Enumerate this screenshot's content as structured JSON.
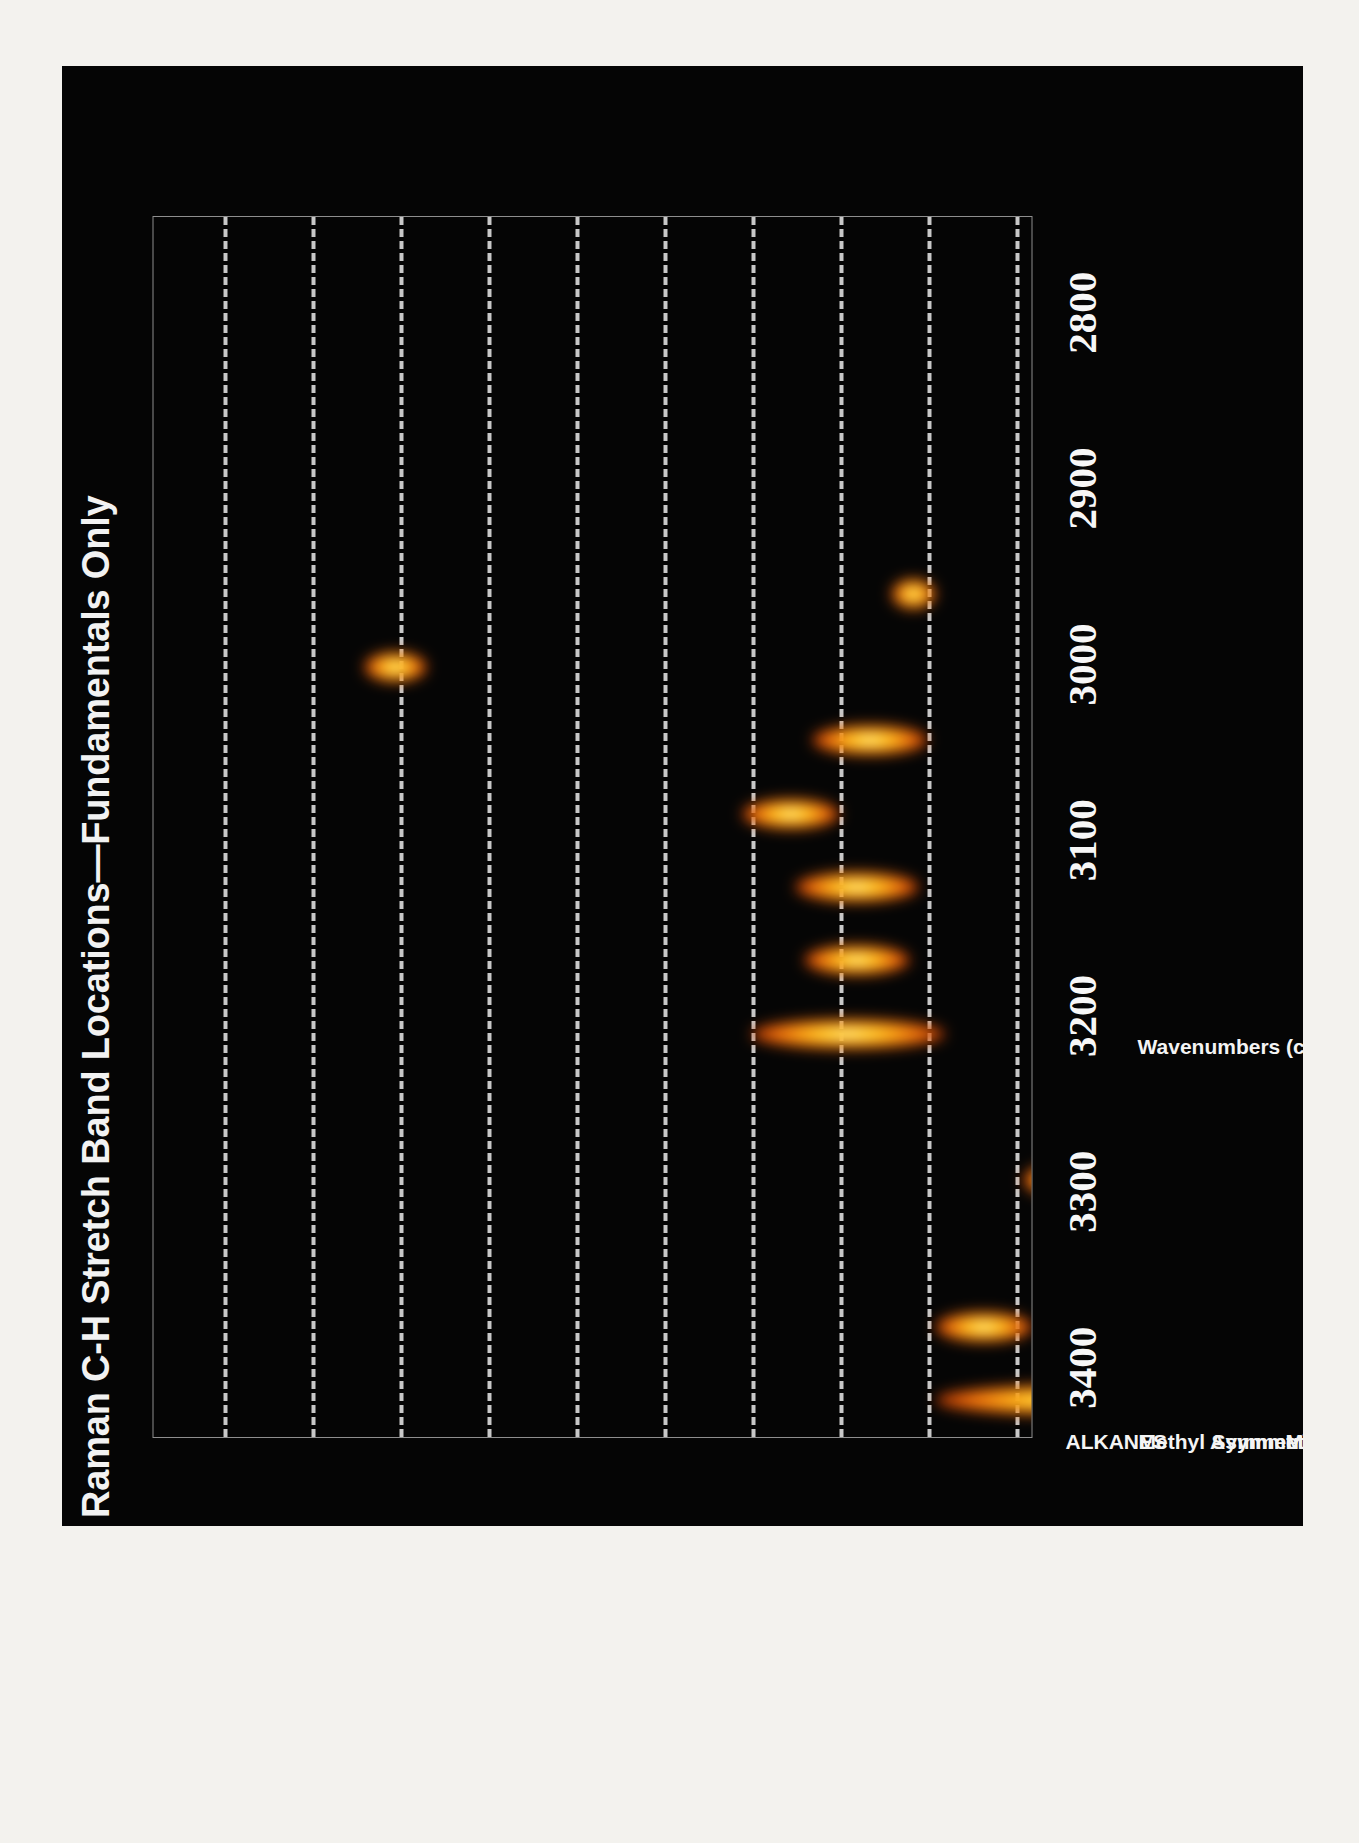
{
  "title": "Raman C-H Stretch Band Locations—Fundamentals Only",
  "axis_title_text": "Wavenumbers (cm",
  "axis_title_sup": "-1",
  "axis_title_tail": ")",
  "colors": {
    "background": "#050505",
    "paper": "#f3f2ee",
    "text": "#f4f4f4",
    "gridline": "#d9d9d9",
    "frame": "#8e8e8e",
    "band_core": "#ffffe6",
    "band_mid": "#ffc21e",
    "band_edge": "#b52c02"
  },
  "chart_data": {
    "type": "scatter",
    "title": "Raman C-H Stretch Band Locations—Fundamentals Only",
    "xlabel": "Wavenumbers (cm-1)",
    "ylabel": "",
    "xlim": [
      3440,
      2745
    ],
    "x_reversed": true,
    "grid": true,
    "grid_spacing": 50,
    "legend": "none",
    "tick_labels": [
      "3400",
      "3300",
      "3200",
      "3100",
      "3000",
      "2900",
      "2800"
    ],
    "tick_values": [
      3400,
      3300,
      3200,
      3100,
      3000,
      2900,
      2800
    ],
    "categories": [
      "ALKANES",
      "Methyl Asymmetric",
      "Symmetric",
      "Methylene Asymmetric",
      "Symmetric",
      "ALKENES",
      "Monosubstituted",
      "Cis, disubstituted",
      "Trans, disubstituted",
      "Gem, disubstituted",
      "Trisubstitited",
      "AROMATICS"
    ],
    "band_label_extra": "ALKYNES",
    "series": [
      {
        "name": "ALKANES",
        "category_index": 0,
        "range": [
          2995,
          2845
        ],
        "center": 2920,
        "width": 150
      },
      {
        "name": "Methyl Asymmetric",
        "category_index": 1,
        "range": [
          2995,
          2940
        ],
        "center": 2967,
        "width": 55
      },
      {
        "name": "Symmetric",
        "category_index": 2,
        "range": [
          2895,
          2845
        ],
        "center": 2870,
        "width": 50
      },
      {
        "name": "Methylene Asymmetric",
        "category_index": 3,
        "range": [
          2945,
          2910
        ],
        "center": 2928,
        "width": 35
      },
      {
        "name": "Symmetric",
        "category_index": 4,
        "range": [
          2875,
          2855
        ],
        "center": 2865,
        "width": 20
      },
      {
        "name": "ALKENES",
        "category_index": 5,
        "range": [
          3100,
          2990
        ],
        "center": 3045,
        "width": 110
      },
      {
        "name": "Monosubstituted",
        "category_index": 6,
        "range": [
          3070,
          3010
        ],
        "center": 3040,
        "width": 60
      },
      {
        "name": "Trans, disubstituted",
        "category_index": 7,
        "range": [
          3075,
          3005
        ],
        "center": 3040,
        "width": 70
      },
      {
        "name": "Gem, disubstituted",
        "category_index": 8,
        "range": [
          3105,
          3050
        ],
        "center": 3078,
        "width": 55
      },
      {
        "name": "Trisubstitited",
        "category_index": 9,
        "range": [
          3065,
          3000
        ],
        "center": 3033,
        "width": 65
      },
      {
        "name": "ALKYNES",
        "category_index": 10,
        "range": [
          3320,
          3285
        ],
        "center": 3303,
        "width": 35
      },
      {
        "name": "AROMATICS",
        "category_index": 11,
        "range": [
          3020,
          2995
        ],
        "center": 3008,
        "width": 25
      }
    ]
  },
  "gridlines": [
    3400,
    3350,
    3300,
    3250,
    3200,
    3150,
    3100,
    3050,
    3000,
    2950,
    2900,
    2850,
    2800,
    2750
  ]
}
